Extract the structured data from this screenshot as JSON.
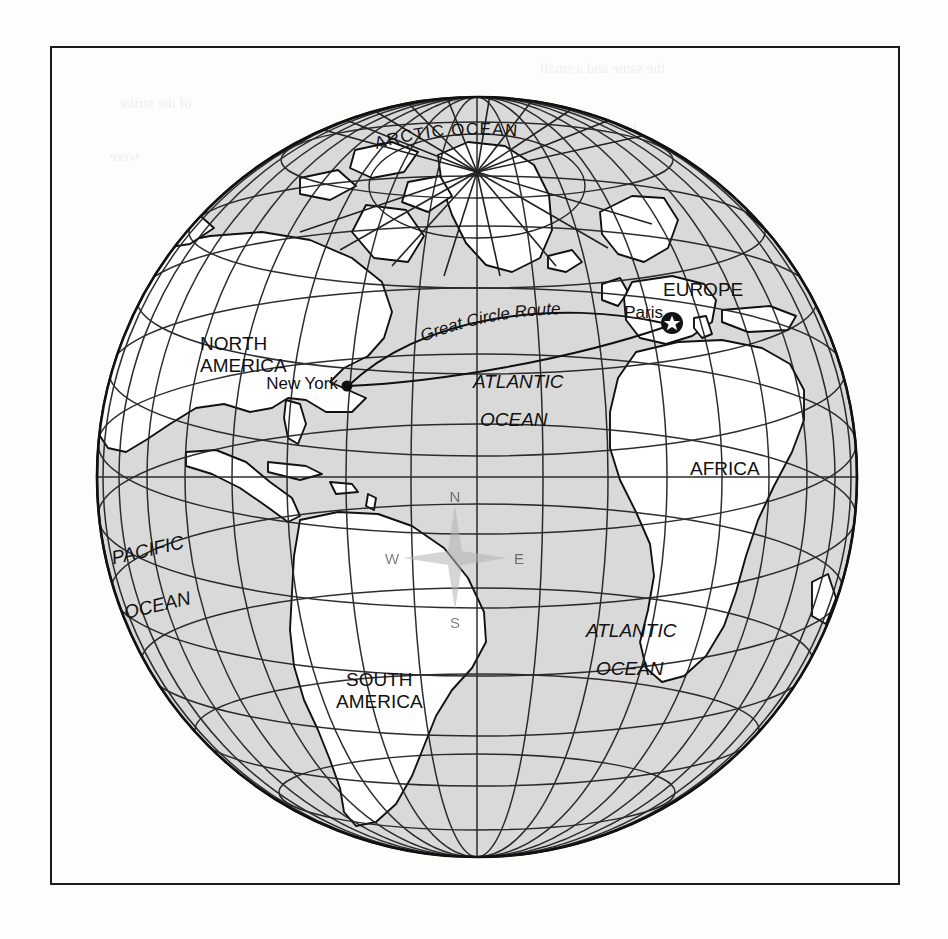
{
  "figure": {
    "frame": {
      "border_color": "#1b1b1b"
    },
    "globe": {
      "center_x": 477,
      "center_y": 477,
      "radius": 380,
      "ocean_fill": "#d9d9d9",
      "land_fill": "#ffffff",
      "outline_color": "#111111",
      "graticule_color": "#222222",
      "graticule_spacing_degrees": 15,
      "projection": "orthographic"
    },
    "labels": {
      "arctic_ocean": "ARCTIC OCEAN",
      "north_america_line1": "NORTH",
      "north_america_line2": "AMERICA",
      "south_america_line1": "SOUTH",
      "south_america_line2": "AMERICA",
      "europe": "EUROPE",
      "africa": "AFRICA",
      "pacific_ocean_line1": "PACIFIC",
      "pacific_ocean_line2": "OCEAN",
      "atlantic_north_line1": "ATLANTIC",
      "atlantic_north_line2": "OCEAN",
      "atlantic_south_line1": "ATLANTIC",
      "atlantic_south_line2": "OCEAN"
    },
    "cities": [
      {
        "name": "New York",
        "marker": "dot",
        "x": 345,
        "y": 385,
        "label_x": 338,
        "label_y": 383
      },
      {
        "name": "Paris",
        "marker": "star-in-circle",
        "x": 672,
        "y": 323,
        "label_x": 663,
        "label_y": 311
      }
    ],
    "route": {
      "label": "Great Circle Route",
      "type": "great-circle",
      "from": "New York",
      "to": "Paris",
      "style": "solid-arc"
    },
    "compass_rose": {
      "north": "N",
      "east": "E",
      "south": "S",
      "west": "W",
      "color": "#b3b3b3",
      "center_x": 455,
      "center_y": 558
    }
  },
  "bleed_through_text": [
    {
      "text": "the same and a small",
      "x": 540,
      "y": 60
    },
    {
      "text": "of the strike",
      "x": 120,
      "y": 95
    },
    {
      "text": "by the",
      "x": 600,
      "y": 120
    },
    {
      "text": "were",
      "x": 110,
      "y": 148
    },
    {
      "text": "of the strip",
      "x": 640,
      "y": 178
    },
    {
      "text": "and then the second",
      "x": 300,
      "y": 300
    },
    {
      "text": "designation line",
      "x": 255,
      "y": 455
    },
    {
      "text": "the zone limit",
      "x": 280,
      "y": 478
    },
    {
      "text": "everyone who is on",
      "x": 175,
      "y": 500
    },
    {
      "text": "every wind also found",
      "x": 200,
      "y": 524
    },
    {
      "text": "W routes on our map",
      "x": 380,
      "y": 548
    }
  ]
}
